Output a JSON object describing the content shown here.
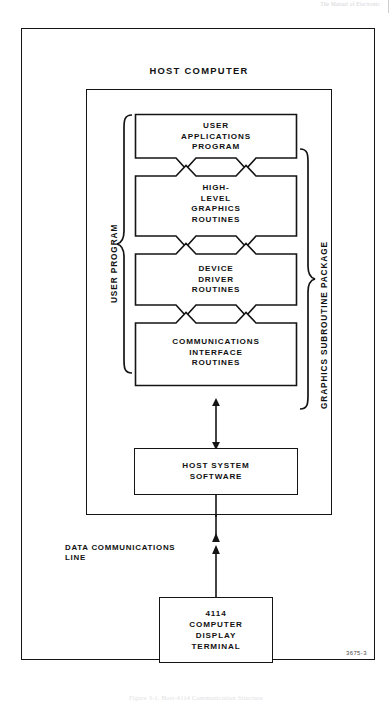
{
  "page": {
    "running_header": "The Manual of Electronic",
    "figure_code": "3675-3",
    "caption": "Figure 3-1. Host-4114 Communication Structure"
  },
  "diagram": {
    "host_computer_label": "HOST COMPUTER",
    "user_program_label": "USER PROGRAM",
    "graphics_package_label": "GRAPHICS SUBROUTINE PACKAGE",
    "data_communications_label": "DATA COMMUNICATIONS\nLINE",
    "layers": [
      {
        "id": "user-applications-program",
        "lines": [
          "USER",
          "APPLICATIONS",
          "PROGRAM"
        ]
      },
      {
        "id": "high-level-graphics-routines",
        "lines": [
          "HIGH-",
          "LEVEL",
          "GRAPHICS",
          "ROUTINES"
        ]
      },
      {
        "id": "device-driver-routines",
        "lines": [
          "DEVICE",
          "DRIVER",
          "ROUTINES"
        ]
      },
      {
        "id": "communications-interface-routines",
        "lines": [
          "COMMUNICATIONS",
          "INTERFACE",
          "ROUTINES"
        ]
      }
    ],
    "host_system_software": {
      "lines": [
        "HOST SYSTEM",
        "SOFTWARE"
      ]
    },
    "terminal": {
      "lines": [
        "4114",
        "COMPUTER",
        "DISPLAY",
        "TERMINAL"
      ]
    }
  },
  "colors": {
    "ink": "#141414",
    "paper": "#ffffff",
    "faint": "#d2d2d6"
  }
}
